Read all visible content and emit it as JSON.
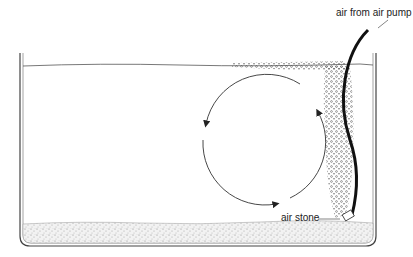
{
  "diagram": {
    "labels": {
      "air_pump": "air from air pump",
      "air_stone": "air stone"
    },
    "colors": {
      "line": "#333333",
      "tube": "#111111",
      "gravel": "#bdbdbd",
      "bubbles": "#444444"
    }
  }
}
